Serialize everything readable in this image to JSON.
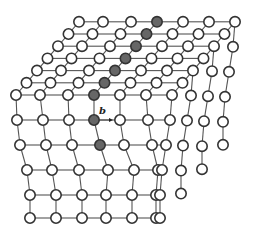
{
  "diagram": {
    "title": "",
    "colors": {
      "background": "#ffffff",
      "edge": "#555555",
      "node_fill": "#ffffff",
      "node_stroke": "#333333",
      "highlight_fill": "#666666"
    },
    "lattice": {
      "columns": 7,
      "rows": 6,
      "layers": 7,
      "node_radius": 5.2
    },
    "highlighted_nodes_description": "diagonal line of dark atoms running from front-top toward back-top along the top face, continuing down the front face column",
    "burgers_vector": {
      "label": "b",
      "arrow_from": [
        100,
        120
      ],
      "arrow_to": [
        113,
        120
      ],
      "label_pos": [
        99,
        114
      ]
    }
  }
}
